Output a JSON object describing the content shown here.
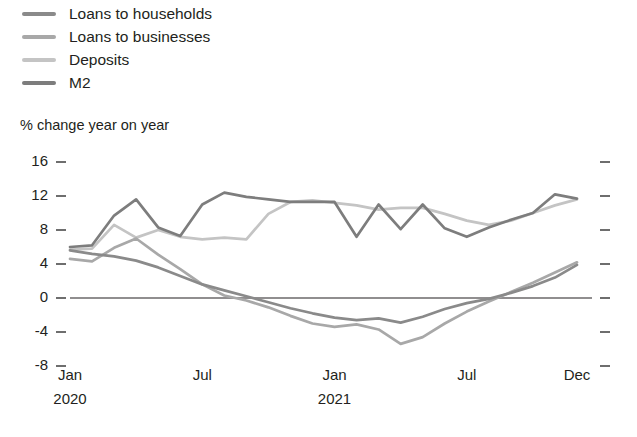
{
  "legend": {
    "items": [
      {
        "label": "Loans to households",
        "color": "#8a8a8a",
        "swatch_name": "legend-swatch-loans-households"
      },
      {
        "label": "Loans to businesses",
        "color": "#a8a8a8",
        "swatch_name": "legend-swatch-loans-businesses"
      },
      {
        "label": "Deposits",
        "color": "#c4c4c4",
        "swatch_name": "legend-swatch-deposits"
      },
      {
        "label": "M2",
        "color": "#7d7d7d",
        "swatch_name": "legend-swatch-m2"
      }
    ]
  },
  "axis_title": "% change year on year",
  "yticks": [
    "16",
    "12",
    "8",
    "4",
    "0",
    "-4",
    "-8"
  ],
  "xticks": [
    {
      "label": "Jan",
      "sub": "2020"
    },
    {
      "label": "Jul",
      "sub": ""
    },
    {
      "label": "Jan",
      "sub": "2021"
    },
    {
      "label": "Jul",
      "sub": ""
    },
    {
      "label": "Dec",
      "sub": ""
    }
  ],
  "bottom_note": "",
  "chart_data": {
    "type": "line",
    "title": "",
    "subtitle": "",
    "xlabel": "",
    "ylabel": "% change year on year",
    "ylim": [
      -8,
      16
    ],
    "ytick_values": [
      16,
      12,
      8,
      4,
      0,
      -4,
      -8
    ],
    "grid": false,
    "zero_line": true,
    "zero_line_color": "#231f20",
    "legend_position": "top-left",
    "x": [
      "Jan 2020",
      "Feb 2020",
      "Mar 2020",
      "Apr 2020",
      "May 2020",
      "Jun 2020",
      "Jul 2020",
      "Aug 2020",
      "Sep 2020",
      "Oct 2020",
      "Nov 2020",
      "Dec 2020",
      "Jan 2021",
      "Feb 2021",
      "Mar 2021",
      "Apr 2021",
      "May 2021",
      "Jun 2021",
      "Jul 2021",
      "Aug 2021",
      "Sep 2021",
      "Oct 2021",
      "Nov 2021",
      "Dec 2021"
    ],
    "xtick_labels": [
      "Jan 2020",
      "Jul",
      "Jan 2021",
      "Jul",
      "Dec"
    ],
    "xtick_indices": [
      0,
      6,
      12,
      18,
      23
    ],
    "series": [
      {
        "name": "Loans to households",
        "color": "#8a8a8a",
        "values": [
          5.6,
          5.2,
          4.9,
          4.4,
          3.6,
          2.6,
          1.6,
          0.9,
          0.2,
          -0.5,
          -1.2,
          -1.8,
          -2.3,
          -2.6,
          -2.4,
          -2.9,
          -2.2,
          -1.3,
          -0.6,
          -0.1,
          0.6,
          1.4,
          2.4,
          3.9
        ]
      },
      {
        "name": "Loans to businesses",
        "color": "#a8a8a8",
        "values": [
          4.6,
          4.3,
          5.9,
          7.0,
          5.1,
          3.4,
          1.6,
          0.3,
          -0.3,
          -1.1,
          -2.1,
          -3.0,
          -3.4,
          -3.1,
          -3.7,
          -5.4,
          -4.6,
          -3.0,
          -1.6,
          -0.4,
          0.7,
          1.8,
          3.0,
          4.2
        ]
      },
      {
        "name": "Deposits",
        "color": "#c4c4c4",
        "values": [
          5.7,
          5.8,
          8.6,
          7.1,
          8.0,
          7.2,
          6.9,
          7.1,
          6.9,
          9.9,
          11.3,
          11.5,
          11.2,
          10.9,
          10.4,
          10.6,
          10.6,
          9.9,
          9.1,
          8.6,
          9.1,
          10.0,
          10.9,
          11.6
        ]
      },
      {
        "name": "M2",
        "color": "#7d7d7d",
        "values": [
          6.0,
          6.2,
          9.7,
          11.6,
          8.3,
          7.3,
          11.0,
          12.4,
          11.9,
          11.6,
          11.3,
          11.3,
          11.3,
          7.2,
          11.0,
          8.1,
          11.0,
          8.2,
          7.2,
          8.3,
          9.2,
          10.0,
          12.2,
          11.7
        ]
      }
    ]
  }
}
